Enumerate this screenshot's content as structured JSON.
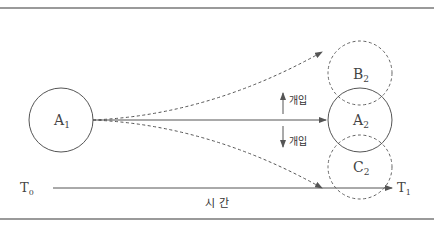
{
  "diagram": {
    "circles": [
      {
        "id": "A1",
        "label": "A",
        "sub": "1",
        "style": "solid"
      },
      {
        "id": "A2",
        "label": "A",
        "sub": "2",
        "style": "solid"
      },
      {
        "id": "B2",
        "label": "B",
        "sub": "2",
        "style": "dashed"
      },
      {
        "id": "C2",
        "label": "C",
        "sub": "2",
        "style": "dashed"
      }
    ],
    "interventions": [
      {
        "direction": "up",
        "label": "개입"
      },
      {
        "direction": "down",
        "label": "개입"
      }
    ],
    "time_axis": {
      "start_label": "T",
      "start_sub": "0",
      "end_label": "T",
      "end_sub": "1",
      "caption": "시 간"
    },
    "colors": {
      "line": "#555555",
      "text": "#444444",
      "rule": "#9a9a9a"
    }
  }
}
